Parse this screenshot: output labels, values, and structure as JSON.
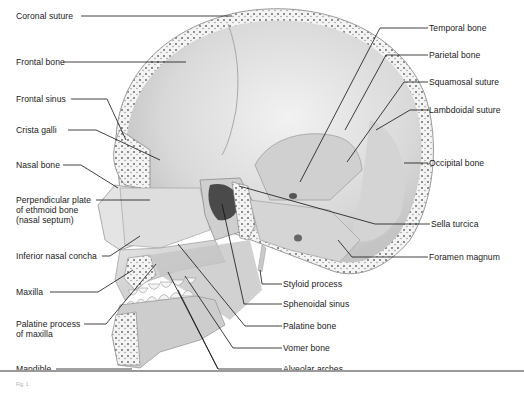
{
  "figure": {
    "caption_fragment": "Fig. 1",
    "accent_color": "#1a1a1a"
  },
  "labels_left": [
    {
      "id": "coronal-suture",
      "text": "Coronal suture",
      "x": 16,
      "y": 12
    },
    {
      "id": "frontal-bone",
      "text": "Frontal bone",
      "x": 16,
      "y": 58
    },
    {
      "id": "frontal-sinus",
      "text": "Frontal sinus",
      "x": 16,
      "y": 95
    },
    {
      "id": "crista-galli",
      "text": "Crista galli",
      "x": 16,
      "y": 126
    },
    {
      "id": "nasal-bone",
      "text": "Nasal bone",
      "x": 16,
      "y": 161
    },
    {
      "id": "perpendicular-plate",
      "text": "Perpendicular plate",
      "x": 16,
      "y": 196
    },
    {
      "id": "perpendicular-plate-2",
      "text": "of ethmoid bone",
      "x": 16,
      "y": 206
    },
    {
      "id": "perpendicular-plate-3",
      "text": "(nasal septum)",
      "x": 16,
      "y": 216
    },
    {
      "id": "inferior-nasal-concha",
      "text": "Inferior nasal concha",
      "x": 16,
      "y": 252
    },
    {
      "id": "maxilla",
      "text": "Maxilla",
      "x": 16,
      "y": 288
    },
    {
      "id": "palatine-process",
      "text": "Palatine process",
      "x": 16,
      "y": 320
    },
    {
      "id": "palatine-process-2",
      "text": "of maxilla",
      "x": 16,
      "y": 330
    },
    {
      "id": "mandible",
      "text": "Mandible",
      "x": 16,
      "y": 365
    }
  ],
  "labels_right": [
    {
      "id": "temporal-bone",
      "text": "Temporal bone",
      "x": 428,
      "y": 25
    },
    {
      "id": "parietal-bone",
      "text": "Parietal bone",
      "x": 428,
      "y": 51
    },
    {
      "id": "squamosal-suture",
      "text": "Squamosal suture",
      "x": 428,
      "y": 78
    },
    {
      "id": "lambdoidal-suture",
      "text": "Lambdoidal suture",
      "x": 428,
      "y": 106
    },
    {
      "id": "occipital-bone",
      "text": "Occipital bone",
      "x": 428,
      "y": 159
    },
    {
      "id": "sella-turcica",
      "text": "Sella turcica",
      "x": 430,
      "y": 220
    },
    {
      "id": "foramen-magnum",
      "text": "Foramen magnum",
      "x": 428,
      "y": 253
    },
    {
      "id": "styloid-process",
      "text": "Styloid process",
      "x": 282,
      "y": 280
    },
    {
      "id": "sphenoidal-sinus",
      "text": "Sphenoidal sinus",
      "x": 282,
      "y": 300
    },
    {
      "id": "palatine-bone",
      "text": "Palatine bone",
      "x": 282,
      "y": 322
    },
    {
      "id": "vomer-bone",
      "text": "Vomer bone",
      "x": 282,
      "y": 344
    },
    {
      "id": "alveolar-arches",
      "text": "Alveolar arches",
      "x": 282,
      "y": 365
    }
  ]
}
